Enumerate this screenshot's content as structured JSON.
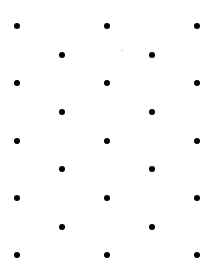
{
  "figure": {
    "width": 218,
    "height": 271,
    "background_color": "#ffffff",
    "dot_color": "#000000",
    "dot_diameter": 6,
    "speck_color": "#e8e8e8"
  },
  "chart_data": {
    "type": "scatter",
    "xlabel": "",
    "ylabel": "",
    "xlim": [
      0,
      218
    ],
    "ylim": [
      0,
      271
    ],
    "grid": false,
    "legend": null,
    "marker": "circle",
    "marker_size": 6,
    "marker_color": "#000000",
    "row_y": [
      26,
      55,
      83,
      112,
      141,
      169,
      198,
      227,
      255
    ],
    "column_x_major": [
      17,
      107,
      197
    ],
    "column_x_offset": [
      62,
      152
    ],
    "point_count": 23,
    "rows": [
      {
        "index": 1,
        "y": 26,
        "kind": "major",
        "x": [
          17,
          107,
          197
        ]
      },
      {
        "index": 2,
        "y": 55,
        "kind": "offset",
        "x": [
          62,
          152
        ]
      },
      {
        "index": 3,
        "y": 83,
        "kind": "major",
        "x": [
          17,
          107,
          197
        ]
      },
      {
        "index": 4,
        "y": 112,
        "kind": "offset",
        "x": [
          62,
          152
        ]
      },
      {
        "index": 5,
        "y": 141,
        "kind": "major",
        "x": [
          17,
          107,
          197
        ]
      },
      {
        "index": 6,
        "y": 169,
        "kind": "offset",
        "x": [
          62,
          152
        ]
      },
      {
        "index": 7,
        "y": 198,
        "kind": "major",
        "x": [
          17,
          107,
          197
        ]
      },
      {
        "index": 8,
        "y": 227,
        "kind": "offset",
        "x": [
          62,
          152
        ]
      },
      {
        "index": 9,
        "y": 255,
        "kind": "major",
        "x": [
          17,
          107,
          197
        ]
      }
    ],
    "points": [
      {
        "x": 17,
        "y": 26
      },
      {
        "x": 107,
        "y": 26
      },
      {
        "x": 197,
        "y": 26
      },
      {
        "x": 62,
        "y": 55
      },
      {
        "x": 152,
        "y": 55
      },
      {
        "x": 17,
        "y": 83
      },
      {
        "x": 107,
        "y": 83
      },
      {
        "x": 197,
        "y": 83
      },
      {
        "x": 62,
        "y": 112
      },
      {
        "x": 152,
        "y": 112
      },
      {
        "x": 17,
        "y": 141
      },
      {
        "x": 107,
        "y": 141
      },
      {
        "x": 197,
        "y": 141
      },
      {
        "x": 62,
        "y": 169
      },
      {
        "x": 152,
        "y": 169
      },
      {
        "x": 17,
        "y": 198
      },
      {
        "x": 107,
        "y": 198
      },
      {
        "x": 197,
        "y": 198
      },
      {
        "x": 62,
        "y": 227
      },
      {
        "x": 152,
        "y": 227
      },
      {
        "x": 17,
        "y": 255
      },
      {
        "x": 107,
        "y": 255
      },
      {
        "x": 197,
        "y": 255
      }
    ],
    "artifacts": [
      {
        "x": 122,
        "y": 50,
        "size": 3,
        "color": "#e8e8e8"
      }
    ]
  }
}
